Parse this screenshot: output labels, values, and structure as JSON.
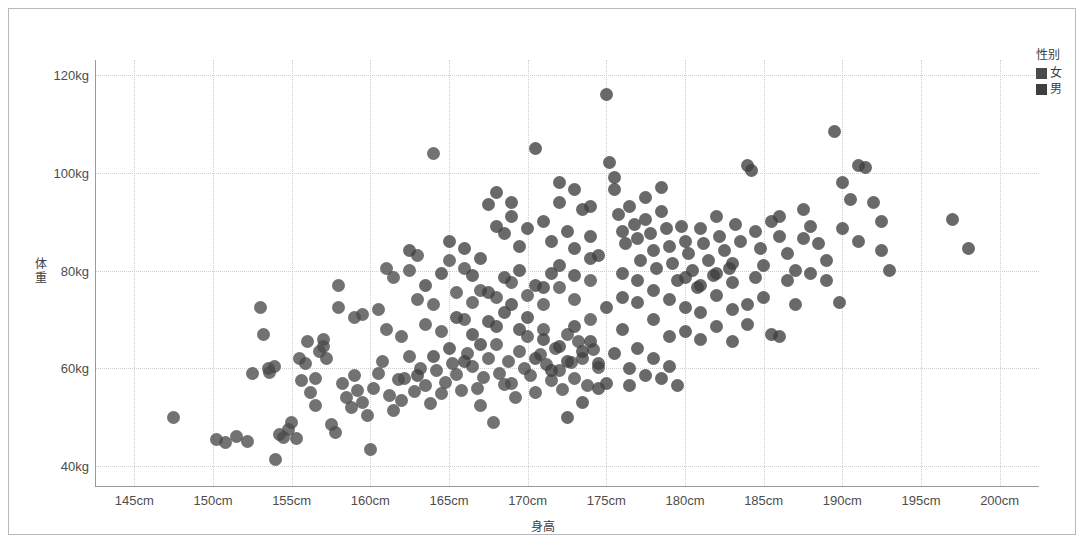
{
  "chart_data": {
    "type": "scatter",
    "title": "",
    "xlabel": "身高",
    "ylabel": "体重",
    "xlim": [
      142.5,
      202.5
    ],
    "ylim": [
      36,
      123
    ],
    "x_ticks": [
      "145cm",
      "150cm",
      "155cm",
      "160cm",
      "165cm",
      "170cm",
      "175cm",
      "180cm",
      "185cm",
      "190cm",
      "195cm",
      "200cm"
    ],
    "x_tick_values": [
      145,
      150,
      155,
      160,
      165,
      170,
      175,
      180,
      185,
      190,
      195,
      200
    ],
    "y_ticks": [
      "40kg",
      "60kg",
      "80kg",
      "100kg",
      "120kg"
    ],
    "y_tick_values": [
      40,
      60,
      80,
      100,
      120
    ],
    "grid": true,
    "grid_style": "dotted",
    "legend_position": "right",
    "point_color": "#4a4a4a",
    "point_opacity": 0.78,
    "point_size": 13,
    "series": [
      {
        "name": "女",
        "color": "#4a4a4a",
        "points": [
          [
            147.5,
            50.0
          ],
          [
            150.2,
            45.5
          ],
          [
            150.8,
            44.8
          ],
          [
            151.5,
            46.2
          ],
          [
            152.2,
            45.0
          ],
          [
            153.0,
            72.5
          ],
          [
            153.2,
            67.0
          ],
          [
            153.6,
            59.2
          ],
          [
            153.9,
            60.5
          ],
          [
            154.0,
            41.5
          ],
          [
            154.5,
            46.0
          ],
          [
            154.8,
            47.5
          ],
          [
            155.0,
            49.0
          ],
          [
            155.3,
            45.8
          ],
          [
            155.6,
            57.5
          ],
          [
            155.9,
            61.0
          ],
          [
            156.2,
            55.0
          ],
          [
            156.5,
            52.5
          ],
          [
            156.8,
            63.5
          ],
          [
            157.0,
            64.5
          ],
          [
            157.2,
            62.0
          ],
          [
            157.5,
            48.5
          ],
          [
            157.8,
            47.0
          ],
          [
            158.0,
            77.0
          ],
          [
            158.2,
            57.0
          ],
          [
            158.5,
            54.0
          ],
          [
            158.8,
            52.0
          ],
          [
            159.0,
            58.5
          ],
          [
            159.2,
            55.5
          ],
          [
            159.5,
            53.0
          ],
          [
            159.8,
            50.5
          ],
          [
            160.0,
            43.5
          ],
          [
            160.2,
            56.0
          ],
          [
            160.5,
            59.0
          ],
          [
            160.8,
            61.5
          ],
          [
            161.0,
            80.5
          ],
          [
            161.2,
            54.5
          ],
          [
            161.5,
            51.5
          ],
          [
            161.8,
            57.8
          ],
          [
            162.0,
            53.5
          ],
          [
            162.2,
            58.0
          ],
          [
            162.5,
            62.5
          ],
          [
            162.8,
            55.2
          ],
          [
            163.0,
            83.0
          ],
          [
            163.2,
            60.0
          ],
          [
            163.5,
            56.5
          ],
          [
            163.8,
            52.8
          ],
          [
            164.0,
            104.0
          ],
          [
            164.2,
            59.5
          ],
          [
            164.5,
            54.8
          ],
          [
            164.8,
            57.2
          ],
          [
            165.0,
            82.0
          ],
          [
            165.2,
            61.0
          ],
          [
            165.5,
            58.8
          ],
          [
            165.8,
            55.5
          ],
          [
            166.0,
            80.5
          ],
          [
            166.2,
            63.0
          ],
          [
            166.5,
            60.5
          ],
          [
            166.8,
            56.0
          ],
          [
            167.0,
            52.5
          ],
          [
            167.2,
            58.2
          ],
          [
            167.5,
            62.0
          ],
          [
            167.8,
            49.0
          ],
          [
            168.0,
            65.0
          ],
          [
            168.2,
            59.0
          ],
          [
            168.5,
            56.8
          ],
          [
            168.8,
            61.5
          ],
          [
            169.0,
            57.0
          ],
          [
            169.2,
            54.0
          ],
          [
            169.5,
            63.5
          ],
          [
            169.8,
            60.0
          ],
          [
            170.0,
            66.5
          ],
          [
            170.2,
            58.5
          ],
          [
            170.5,
            55.0
          ],
          [
            170.8,
            62.8
          ],
          [
            171.0,
            68.0
          ],
          [
            171.2,
            60.8
          ],
          [
            171.5,
            57.5
          ],
          [
            171.8,
            64.0
          ],
          [
            172.0,
            59.5
          ],
          [
            172.2,
            55.8
          ],
          [
            172.5,
            67.0
          ],
          [
            172.8,
            61.2
          ],
          [
            173.0,
            58.0
          ],
          [
            173.2,
            65.5
          ],
          [
            173.5,
            62.0
          ],
          [
            173.8,
            56.5
          ],
          [
            174.0,
            70.0
          ],
          [
            174.2,
            63.8
          ],
          [
            174.5,
            60.2
          ],
          [
            156.0,
            65.5
          ],
          [
            157.0,
            66.0
          ],
          [
            161.5,
            78.5
          ],
          [
            162.5,
            80.0
          ],
          [
            159.5,
            71.0
          ],
          [
            160.5,
            72.0
          ],
          [
            163.0,
            74.0
          ],
          [
            164.0,
            73.0
          ],
          [
            165.5,
            75.5
          ],
          [
            166.5,
            73.5
          ],
          [
            158.0,
            72.5
          ],
          [
            159.0,
            70.5
          ],
          [
            167.0,
            76.0
          ],
          [
            168.0,
            74.5
          ],
          [
            169.0,
            77.5
          ],
          [
            170.0,
            75.0
          ],
          [
            171.0,
            73.0
          ],
          [
            172.0,
            76.5
          ],
          [
            173.0,
            74.0
          ],
          [
            174.0,
            78.0
          ],
          [
            161.0,
            68.0
          ],
          [
            162.0,
            66.5
          ],
          [
            163.5,
            69.0
          ],
          [
            164.5,
            67.5
          ],
          [
            166.0,
            70.0
          ],
          [
            152.5,
            59.0
          ],
          [
            153.5,
            60.0
          ],
          [
            155.5,
            62.0
          ],
          [
            156.5,
            58.0
          ],
          [
            154.2,
            46.5
          ]
        ]
      },
      {
        "name": "男",
        "color": "#3f3f3f",
        "points": [
          [
            167.5,
            93.5
          ],
          [
            168.0,
            89.0
          ],
          [
            168.5,
            87.5
          ],
          [
            169.0,
            91.0
          ],
          [
            169.5,
            85.0
          ],
          [
            170.0,
            88.5
          ],
          [
            170.5,
            105.0
          ],
          [
            171.0,
            90.0
          ],
          [
            171.5,
            86.0
          ],
          [
            172.0,
            94.0
          ],
          [
            172.5,
            88.0
          ],
          [
            173.0,
            84.5
          ],
          [
            173.5,
            92.5
          ],
          [
            174.0,
            87.0
          ],
          [
            174.5,
            83.0
          ],
          [
            175.0,
            116.0
          ],
          [
            175.2,
            102.0
          ],
          [
            175.5,
            96.5
          ],
          [
            175.8,
            91.5
          ],
          [
            176.0,
            88.0
          ],
          [
            176.2,
            85.5
          ],
          [
            176.5,
            93.0
          ],
          [
            176.8,
            89.5
          ],
          [
            177.0,
            86.5
          ],
          [
            177.2,
            82.0
          ],
          [
            177.5,
            90.5
          ],
          [
            177.8,
            87.5
          ],
          [
            178.0,
            84.0
          ],
          [
            178.2,
            80.5
          ],
          [
            178.5,
            92.0
          ],
          [
            178.8,
            88.5
          ],
          [
            179.0,
            85.0
          ],
          [
            179.2,
            81.5
          ],
          [
            179.5,
            78.0
          ],
          [
            179.8,
            89.0
          ],
          [
            180.0,
            86.0
          ],
          [
            180.2,
            83.5
          ],
          [
            180.5,
            80.0
          ],
          [
            180.8,
            76.5
          ],
          [
            181.0,
            88.5
          ],
          [
            181.2,
            85.5
          ],
          [
            181.5,
            82.0
          ],
          [
            181.8,
            79.0
          ],
          [
            182.0,
            91.0
          ],
          [
            182.2,
            87.0
          ],
          [
            182.5,
            84.0
          ],
          [
            182.8,
            80.5
          ],
          [
            183.0,
            77.5
          ],
          [
            183.2,
            89.5
          ],
          [
            183.5,
            86.0
          ],
          [
            184.0,
            101.5
          ],
          [
            184.2,
            100.5
          ],
          [
            184.5,
            88.0
          ],
          [
            184.8,
            84.5
          ],
          [
            185.0,
            81.0
          ],
          [
            185.5,
            90.0
          ],
          [
            186.0,
            87.0
          ],
          [
            186.5,
            83.5
          ],
          [
            187.0,
            80.0
          ],
          [
            187.5,
            92.5
          ],
          [
            188.0,
            89.0
          ],
          [
            188.5,
            85.5
          ],
          [
            189.0,
            82.0
          ],
          [
            189.5,
            108.5
          ],
          [
            190.0,
            98.0
          ],
          [
            190.5,
            94.5
          ],
          [
            191.0,
            101.5
          ],
          [
            191.5,
            101.0
          ],
          [
            192.0,
            94.0
          ],
          [
            192.5,
            90.0
          ],
          [
            193.0,
            80.0
          ],
          [
            197.0,
            90.5
          ],
          [
            198.0,
            84.5
          ],
          [
            189.8,
            73.5
          ],
          [
            187.0,
            73.0
          ],
          [
            186.0,
            66.5
          ],
          [
            184.0,
            69.0
          ],
          [
            183.0,
            72.0
          ],
          [
            182.0,
            75.0
          ],
          [
            181.0,
            71.5
          ],
          [
            180.0,
            67.5
          ],
          [
            179.0,
            60.5
          ],
          [
            178.0,
            70.0
          ],
          [
            177.0,
            73.5
          ],
          [
            176.0,
            68.0
          ],
          [
            175.0,
            57.0
          ],
          [
            174.5,
            56.0
          ],
          [
            176.5,
            56.5
          ],
          [
            173.5,
            53.0
          ],
          [
            172.5,
            50.0
          ],
          [
            171.5,
            79.5
          ],
          [
            170.5,
            77.0
          ],
          [
            169.5,
            80.0
          ],
          [
            168.5,
            78.5
          ],
          [
            167.5,
            75.5
          ],
          [
            166.5,
            79.0
          ],
          [
            165.0,
            86.0
          ],
          [
            166.0,
            84.5
          ],
          [
            167.0,
            82.5
          ],
          [
            164.5,
            79.5
          ],
          [
            163.5,
            77.0
          ],
          [
            162.5,
            84.0
          ],
          [
            168.0,
            96.0
          ],
          [
            169.0,
            94.0
          ],
          [
            172.0,
            98.0
          ],
          [
            173.0,
            96.5
          ],
          [
            174.0,
            93.0
          ],
          [
            175.5,
            99.0
          ],
          [
            177.5,
            95.0
          ],
          [
            178.5,
            97.0
          ],
          [
            170.0,
            70.5
          ],
          [
            171.0,
            66.0
          ],
          [
            172.0,
            64.5
          ],
          [
            173.0,
            68.5
          ],
          [
            174.0,
            65.5
          ],
          [
            175.0,
            72.5
          ],
          [
            176.0,
            74.5
          ],
          [
            177.0,
            64.0
          ],
          [
            178.0,
            62.0
          ],
          [
            179.0,
            66.5
          ],
          [
            180.0,
            72.5
          ],
          [
            181.0,
            66.0
          ],
          [
            182.0,
            68.5
          ],
          [
            183.0,
            65.5
          ],
          [
            184.0,
            73.0
          ],
          [
            185.0,
            74.5
          ],
          [
            185.5,
            67.0
          ],
          [
            186.5,
            78.0
          ],
          [
            188.0,
            79.5
          ],
          [
            189.0,
            78.0
          ],
          [
            190.0,
            88.5
          ],
          [
            191.0,
            86.0
          ],
          [
            192.5,
            84.0
          ],
          [
            169.0,
            73.0
          ],
          [
            168.0,
            68.5
          ],
          [
            167.0,
            65.0
          ],
          [
            166.0,
            61.5
          ],
          [
            165.0,
            64.0
          ],
          [
            164.0,
            62.5
          ],
          [
            163.0,
            58.5
          ],
          [
            170.5,
            62.0
          ],
          [
            171.5,
            59.5
          ],
          [
            172.5,
            61.5
          ],
          [
            173.5,
            63.5
          ],
          [
            174.5,
            61.0
          ],
          [
            175.5,
            63.0
          ],
          [
            176.5,
            60.0
          ],
          [
            177.5,
            58.5
          ],
          [
            178.5,
            58.0
          ],
          [
            179.5,
            56.5
          ],
          [
            169.5,
            68.0
          ],
          [
            168.5,
            71.5
          ],
          [
            167.5,
            69.5
          ],
          [
            166.5,
            67.0
          ],
          [
            165.5,
            70.5
          ],
          [
            171.0,
            76.5
          ],
          [
            172.0,
            81.0
          ],
          [
            173.0,
            79.0
          ],
          [
            174.0,
            82.5
          ],
          [
            176.0,
            79.5
          ],
          [
            177.0,
            78.0
          ],
          [
            178.0,
            76.0
          ],
          [
            179.0,
            74.0
          ],
          [
            180.0,
            78.5
          ],
          [
            181.0,
            77.0
          ],
          [
            182.0,
            79.5
          ],
          [
            183.0,
            81.5
          ],
          [
            184.5,
            78.5
          ],
          [
            186.0,
            91.0
          ],
          [
            187.5,
            86.5
          ]
        ]
      }
    ]
  },
  "legend": {
    "title": "性别",
    "items": [
      {
        "label": "女",
        "color": "#4a4a4a"
      },
      {
        "label": "男",
        "color": "#3f3f3f"
      }
    ]
  }
}
